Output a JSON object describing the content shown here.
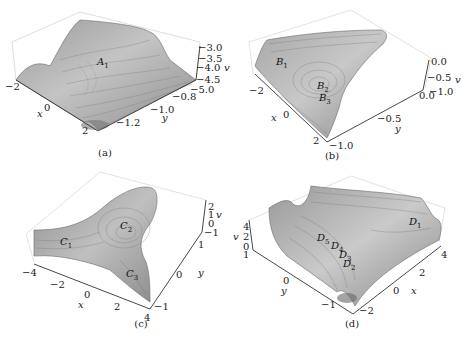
{
  "figure": {
    "panels": [
      {
        "id": "a",
        "caption": "(a)",
        "critical_points": [
          "A1"
        ],
        "axes": {
          "x": {
            "label": "x",
            "ticks": [
              "-2",
              "0",
              "2"
            ]
          },
          "y": {
            "label": "y",
            "ticks": [
              "-0.8",
              "-1.0",
              "-1.2"
            ]
          },
          "v": {
            "label": "v",
            "ticks": [
              "-3.0",
              "-3.5",
              "-4.0",
              "-4.5",
              "-5.0"
            ]
          }
        }
      },
      {
        "id": "b",
        "caption": "(b)",
        "critical_points": [
          "B1",
          "B2",
          "B3"
        ],
        "axes": {
          "x": {
            "label": "x",
            "ticks": [
              "-2",
              "0",
              "2"
            ]
          },
          "y": {
            "label": "y",
            "ticks": [
              "0.0",
              "-0.5",
              "-1.0"
            ]
          },
          "v": {
            "label": "v",
            "ticks": [
              "0.0",
              "-0.5",
              "-1.0"
            ]
          }
        }
      },
      {
        "id": "c",
        "caption": "(c)",
        "critical_points": [
          "C1",
          "C2",
          "C3"
        ],
        "axes": {
          "x": {
            "label": "x",
            "ticks": [
              "-4",
              "-2",
              "0",
              "2",
              "4"
            ]
          },
          "y": {
            "label": "y",
            "ticks": [
              "1",
              "0",
              "-1"
            ]
          },
          "v": {
            "label": "v",
            "ticks": [
              "2",
              "1",
              "0",
              "-1"
            ]
          }
        }
      },
      {
        "id": "d",
        "caption": "(d)",
        "critical_points": [
          "D1",
          "D2",
          "D3",
          "D4",
          "D5"
        ],
        "axes": {
          "x": {
            "label": "x",
            "ticks": [
              "4",
              "2",
              "0",
              "-2"
            ]
          },
          "y": {
            "label": "y",
            "ticks": [
              "1",
              "0",
              "-1"
            ]
          },
          "v": {
            "label": "v",
            "ticks": [
              "4",
              "2",
              "0"
            ]
          }
        }
      }
    ]
  },
  "text": {
    "a": {
      "A1": "A",
      "A1_sub": "1",
      "xt0": "−2",
      "xt1": "0",
      "xt2": "2",
      "xlabel": "x",
      "yt0": "−0.8",
      "yt1": "−1.0",
      "yt2": "−1.2",
      "ylabel": "y",
      "vt0": "−3.0",
      "vt1": "−3.5",
      "vt2": "−4.0",
      "vt3": "−4.5",
      "vt4": "−5.0",
      "vlabel": "v",
      "caption": "(a)"
    },
    "b": {
      "B1": "B",
      "B1_sub": "1",
      "B2": "B",
      "B2_sub": "2",
      "B3": "B",
      "B3_sub": "3",
      "xt0": "−2",
      "xt1": "0",
      "xt2": "2",
      "xlabel": "x",
      "yt0": "0.0",
      "yt1": "−0.5",
      "yt2": "−1.0",
      "ylabel": "y",
      "vt0": "0.0",
      "vt1": "−0.5",
      "vt2": "−1.0",
      "vlabel": "v",
      "caption": "(b)"
    },
    "c": {
      "C1": "C",
      "C1_sub": "1",
      "C2": "C",
      "C2_sub": "2",
      "C3": "C",
      "C3_sub": "3",
      "xt0": "−4",
      "xt1": "−2",
      "xt2": "0",
      "xt3": "2",
      "xt4": "4",
      "xlabel": "x",
      "yt0": "1",
      "yt1": "0",
      "yt2": "−1",
      "ylabel": "y",
      "vt0": "2",
      "vt1": "1",
      "vt2": "0",
      "vt3": "−1",
      "vlabel": "v",
      "caption": "(c)"
    },
    "d": {
      "D1": "D",
      "D1_sub": "1",
      "D2": "D",
      "D2_sub": "2",
      "D3": "D",
      "D3_sub": "3",
      "D4": "D",
      "D4_sub": "4",
      "D5": "D",
      "D5_sub": "5",
      "xt0": "4",
      "xt1": "2",
      "xt2": "0",
      "xt3": "−2",
      "xlabel": "x",
      "yt0": "1",
      "yt1": "0",
      "yt2": "−1",
      "ylabel": "y",
      "vt0": "4",
      "vt1": "2",
      "vt2": "0",
      "vlabel": "v",
      "caption": "(d)"
    }
  }
}
